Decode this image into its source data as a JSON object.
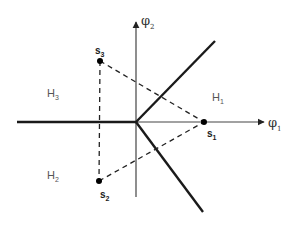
{
  "diagram": {
    "type": "signal-space decision regions",
    "axes": {
      "horizontal": {
        "symbol": "φ",
        "subscript": "1"
      },
      "vertical": {
        "symbol": "φ",
        "subscript": "2"
      }
    },
    "signal_points": [
      {
        "id": "s1",
        "symbol": "s",
        "subscript": "1",
        "x": 204,
        "y": 122
      },
      {
        "id": "s2",
        "symbol": "s",
        "subscript": "2",
        "x": 99,
        "y": 181
      },
      {
        "id": "s3",
        "symbol": "s",
        "subscript": "3",
        "x": 100,
        "y": 61
      }
    ],
    "regions": [
      {
        "id": "H1",
        "symbol": "H",
        "subscript": "1"
      },
      {
        "id": "H2",
        "symbol": "H",
        "subscript": "2"
      },
      {
        "id": "H3",
        "symbol": "H",
        "subscript": "3"
      }
    ],
    "colors": {
      "boundary": "#1a1a1a",
      "axis": "#444444",
      "dashed": "#222222",
      "background": "#ffffff"
    }
  }
}
